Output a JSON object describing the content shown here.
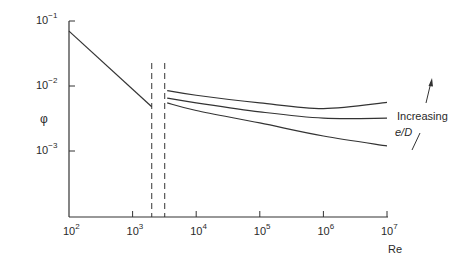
{
  "chart_data": {
    "type": "line",
    "title": "",
    "xlabel": "Re",
    "ylabel": "φ",
    "xscale": "log",
    "yscale": "log",
    "xlim": [
      100,
      10000000
    ],
    "ylim": [
      0.0001,
      0.1
    ],
    "grid": false,
    "x_ticks": [
      "10^2",
      "10^3",
      "10^4",
      "10^5",
      "10^6",
      "10^7"
    ],
    "y_ticks": [
      "10^-1",
      "10^-2",
      "10^-3"
    ],
    "x_tick_labels": [
      {
        "base": "10",
        "exp": "2"
      },
      {
        "base": "10",
        "exp": "3"
      },
      {
        "base": "10",
        "exp": "4"
      },
      {
        "base": "10",
        "exp": "5"
      },
      {
        "base": "10",
        "exp": "6"
      },
      {
        "base": "10",
        "exp": "7"
      }
    ],
    "y_tick_labels": [
      {
        "base": "10",
        "exp": "−1"
      },
      {
        "base": "10",
        "exp": "−2"
      },
      {
        "base": "10",
        "exp": "−3"
      }
    ],
    "vertical_dashed_lines": [
      2000,
      3200
    ],
    "series": [
      {
        "name": "Laminar",
        "x": [
          100,
          2000
        ],
        "y": [
          0.07,
          0.0048
        ]
      },
      {
        "name": "Turbulent (high e/D)",
        "x": [
          3500,
          10000,
          100000,
          1000000,
          10000000
        ],
        "y": [
          0.0085,
          0.0072,
          0.0055,
          0.0045,
          0.0056
        ]
      },
      {
        "name": "Turbulent (medium e/D)",
        "x": [
          3500,
          10000,
          100000,
          1000000,
          10000000
        ],
        "y": [
          0.0065,
          0.0055,
          0.004,
          0.0032,
          0.0032
        ]
      },
      {
        "name": "Turbulent (low e/D)",
        "x": [
          3500,
          10000,
          100000,
          1000000,
          10000000
        ],
        "y": [
          0.0055,
          0.0042,
          0.0027,
          0.0017,
          0.0012
        ]
      }
    ],
    "annotations": [
      {
        "text": "Increasing",
        "note": "arrow pointing upward across curves"
      },
      {
        "text": "e/D",
        "style": "italic"
      }
    ]
  },
  "labels": {
    "ylabel": "φ",
    "xlabel": "Re",
    "annotation_line1": "Increasing",
    "annotation_line2": "e/D"
  }
}
